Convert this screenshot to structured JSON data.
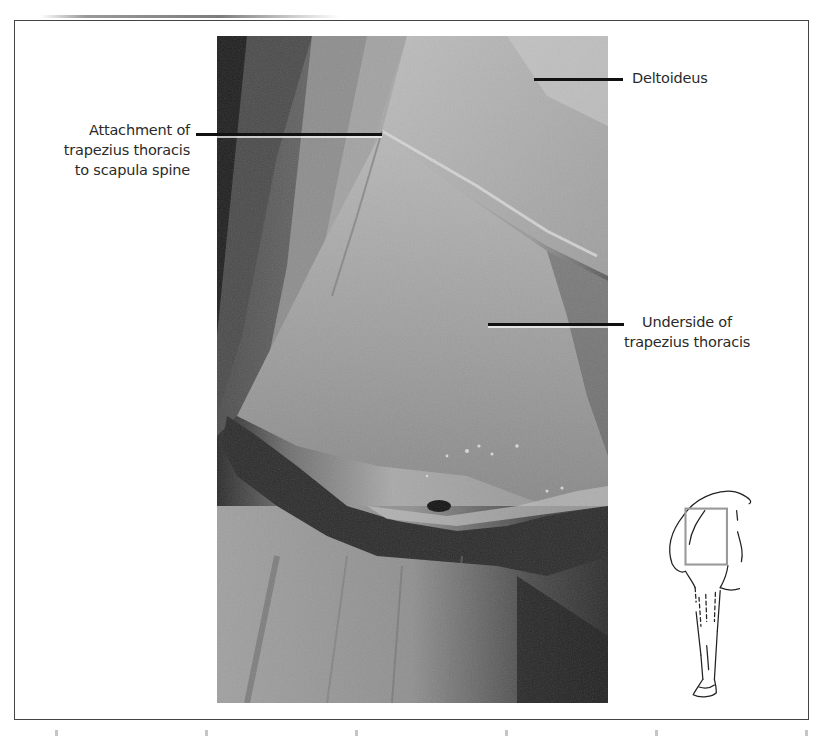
{
  "figure": {
    "type": "anatomical photograph",
    "labels": [
      {
        "id": "deltoideus",
        "text": "Deltoideus",
        "lines": [
          "Deltoideus"
        ]
      },
      {
        "id": "trapezius-attachment",
        "text": "Attachment of trapezius thoracis to scapula spine",
        "lines": [
          "Attachment of",
          "trapezius thoracis",
          "to scapula spine"
        ]
      },
      {
        "id": "trapezius-underside",
        "text": "Underside of trapezius thoracis",
        "lines": [
          "Underside of",
          "trapezius thoracis"
        ]
      }
    ],
    "inset": {
      "description": "Orientation sketch of horse forelimb with highlighted region box",
      "highlight_color": "#9a9a9a"
    }
  },
  "colors": {
    "frame_border": "#444444",
    "leader_line": "#111111",
    "label_text": "#2a2a2a",
    "background": "#ffffff"
  }
}
